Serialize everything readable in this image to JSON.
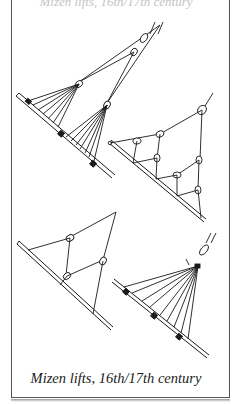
{
  "figure": {
    "top_caption_fragment": "Mizen lifts, 16th/17th century",
    "caption": "Mizen lifts, 16th/17th century",
    "line_color": "#1a1a1a",
    "panels": [
      {
        "id": "top-left",
        "description": "Two crowsfeet lifts fanning from blocks to the yard with cleats"
      },
      {
        "id": "right-middle",
        "description": "Branching lift system with multiple blocks to the yard"
      },
      {
        "id": "bottom-left",
        "description": "Simple two-block lift arrangement"
      },
      {
        "id": "bottom-right",
        "description": "Single crowsfoot fanning to yard with cleats"
      }
    ]
  }
}
